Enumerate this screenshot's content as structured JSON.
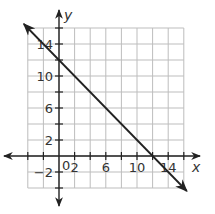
{
  "chart_data": {
    "type": "line",
    "title": "",
    "xlabel": "x",
    "ylabel": "y",
    "xlim": [
      -4,
      16
    ],
    "ylim": [
      -4,
      16
    ],
    "grid": true,
    "grid_step": 2,
    "x_tick_labels": [
      "2",
      "6",
      "10",
      "14"
    ],
    "y_tick_labels": [
      "-2",
      "2",
      "6",
      "10",
      "14"
    ],
    "origin_label": "0",
    "series": [
      {
        "name": "line",
        "equation": "y = -x + 12",
        "x": [
          -4,
          0,
          12,
          16
        ],
        "y": [
          16,
          12,
          0,
          -4
        ],
        "arrows": "both"
      }
    ],
    "colors": {
      "grid": "#bdbdbd",
      "axis": "#222222",
      "line": "#222222"
    }
  }
}
